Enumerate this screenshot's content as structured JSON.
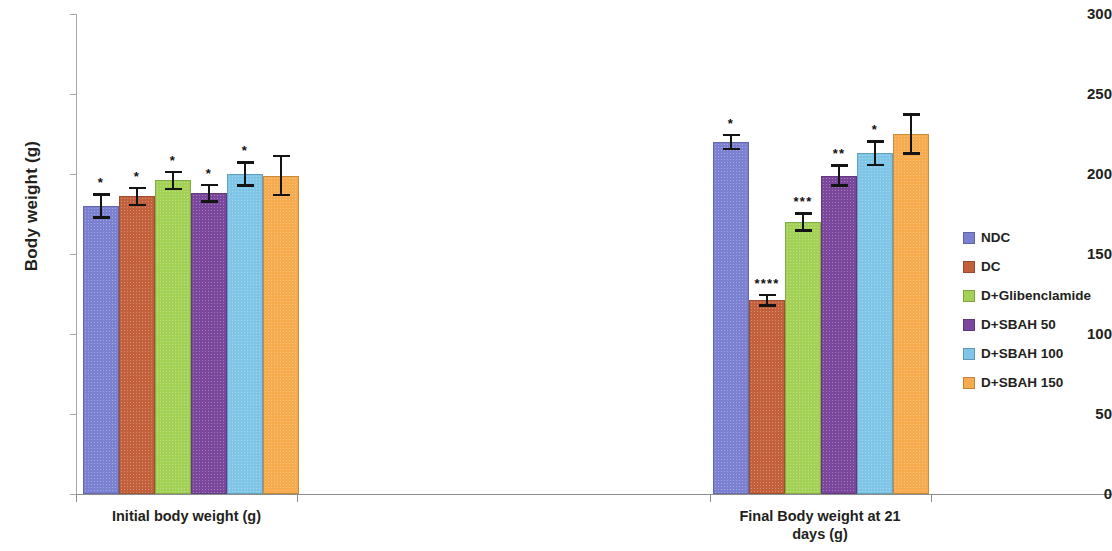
{
  "chart_data": {
    "type": "bar",
    "title": "",
    "xlabel": "",
    "ylabel": "Body weight (g)",
    "ylim": [
      0,
      300
    ],
    "yticks": [
      0,
      50,
      100,
      150,
      200,
      250,
      300
    ],
    "ytick_labels": [
      "0",
      "50",
      "100",
      "150",
      "200",
      "250",
      "300"
    ],
    "grid": false,
    "legend_position": "right",
    "categories": [
      "Initial body weight (g)",
      "Final Body weight at 21 days (g)"
    ],
    "category_label_lines": [
      [
        "Initial body weight (g)"
      ],
      [
        "Final Body weight at 21",
        "days (g)"
      ]
    ],
    "series": [
      {
        "name": "NDC",
        "color": "#7b80d1",
        "values": [
          180,
          220
        ],
        "errors": [
          8,
          5
        ],
        "significance": [
          "*",
          "*"
        ]
      },
      {
        "name": "DC",
        "color": "#c2603c",
        "values": [
          186,
          121
        ],
        "errors": [
          6,
          4
        ],
        "significance": [
          "*",
          "****"
        ]
      },
      {
        "name": "D+Glibenclamide",
        "color": "#a3d155",
        "values": [
          196,
          170
        ],
        "errors": [
          6,
          6
        ],
        "significance": [
          "*",
          "***"
        ]
      },
      {
        "name": "D+SBAH 50",
        "color": "#7b479c",
        "values": [
          188,
          199
        ],
        "errors": [
          6,
          7
        ],
        "significance": [
          "*",
          "**"
        ]
      },
      {
        "name": "D+SBAH 100",
        "color": "#7ec5e8",
        "values": [
          200,
          213
        ],
        "errors": [
          8,
          8
        ],
        "significance": [
          "*",
          "*"
        ]
      },
      {
        "name": "D+SBAH 150",
        "color": "#f5ab4e",
        "values": [
          199,
          225
        ],
        "errors": [
          13,
          13
        ],
        "significance": [
          "",
          ""
        ]
      }
    ]
  },
  "legend": {
    "items": [
      {
        "label": "NDC",
        "color": "#7b80d1"
      },
      {
        "label": "DC",
        "color": "#c2603c"
      },
      {
        "label": "D+Glibenclamide",
        "color": "#a3d155"
      },
      {
        "label": "D+SBAH 50",
        "color": "#7b479c"
      },
      {
        "label": "D+SBAH 100",
        "color": "#7ec5e8"
      },
      {
        "label": "D+SBAH 150",
        "color": "#f5ab4e"
      }
    ]
  },
  "axes": {
    "y_title": "Body weight (g)"
  }
}
